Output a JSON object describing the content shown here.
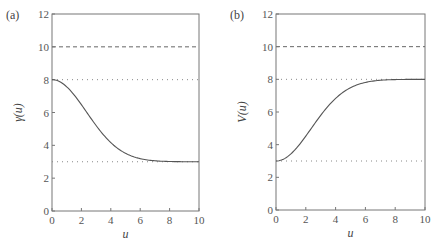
{
  "chart_data": [
    {
      "type": "line",
      "panel_label": "(a)",
      "xlabel": "u",
      "ylabel": "γ(u)",
      "xlim": [
        0,
        10
      ],
      "ylim": [
        0,
        12
      ],
      "xticks": [
        0,
        2,
        4,
        6,
        8,
        10
      ],
      "yticks": [
        0,
        2,
        4,
        6,
        8,
        10,
        12
      ],
      "grid": false,
      "reference_lines": [
        {
          "y": 10,
          "style": "dashed"
        },
        {
          "y": 8,
          "style": "dotted"
        },
        {
          "y": 3,
          "style": "dotted"
        }
      ],
      "series": [
        {
          "name": "γ(u)",
          "style": "solid",
          "x": [
            0,
            1,
            2,
            3,
            4,
            5,
            6,
            7,
            8,
            9,
            10
          ],
          "y": [
            8.0,
            7.56,
            6.52,
            5.21,
            4.17,
            3.52,
            3.19,
            3.06,
            3.02,
            3.0,
            3.0
          ]
        }
      ]
    },
    {
      "type": "line",
      "panel_label": "(b)",
      "xlabel": "u",
      "ylabel": "V(u)",
      "xlim": [
        0,
        10
      ],
      "ylim": [
        0,
        12
      ],
      "xticks": [
        0,
        2,
        4,
        6,
        8,
        10
      ],
      "yticks": [
        0,
        2,
        4,
        6,
        8,
        10,
        12
      ],
      "grid": false,
      "reference_lines": [
        {
          "y": 10,
          "style": "dashed"
        },
        {
          "y": 8,
          "style": "dotted"
        },
        {
          "y": 3,
          "style": "dotted"
        }
      ],
      "series": [
        {
          "name": "V(u)",
          "style": "solid",
          "x": [
            0,
            1,
            2,
            3,
            4,
            5,
            6,
            7,
            8,
            9,
            10
          ],
          "y": [
            3.0,
            3.44,
            4.48,
            5.79,
            6.83,
            7.48,
            7.81,
            7.94,
            7.98,
            8.0,
            8.0
          ]
        }
      ]
    }
  ]
}
